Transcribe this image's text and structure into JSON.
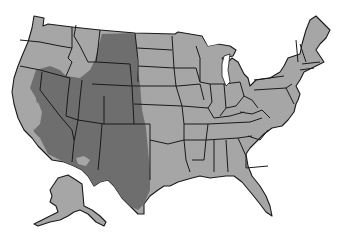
{
  "map": {
    "title": "",
    "region": "United States",
    "colors": {
      "background": "#ffffff",
      "base_fill": "#a6a6a6",
      "highlight_fill": "#6e6e6e",
      "border": "#1a1a1a",
      "water": "#ffffff"
    },
    "highlighted_region": {
      "description": "Shaded area covering the interior West",
      "states_fully": [
        "Nevada",
        "Utah",
        "Arizona",
        "Colorado",
        "New Mexico",
        "Wyoming"
      ],
      "states_partially": [
        "California",
        "Oregon",
        "Idaho",
        "Montana",
        "Texas",
        "Nebraska",
        "South Dakota",
        "Kansas",
        "Oklahoma"
      ]
    },
    "insets": [
      "Alaska"
    ]
  }
}
